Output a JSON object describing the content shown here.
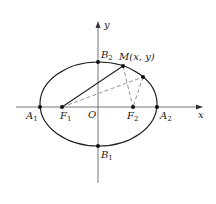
{
  "diagram": {
    "type": "ellipse-foci",
    "axes": {
      "x_label": "x",
      "y_label": "y",
      "origin_label": "O"
    },
    "points": {
      "A1": {
        "label": "A",
        "sub": "1"
      },
      "A2": {
        "label": "A",
        "sub": "2"
      },
      "B1": {
        "label": "B",
        "sub": "1"
      },
      "B2": {
        "label": "B",
        "sub": "2"
      },
      "F1": {
        "label": "F",
        "sub": "1"
      },
      "F2": {
        "label": "F",
        "sub": "2"
      },
      "M": {
        "label": "M(x, y)"
      }
    },
    "colors": {
      "stroke": "#222222",
      "dashed": "#777777",
      "axis": "#555555"
    }
  }
}
